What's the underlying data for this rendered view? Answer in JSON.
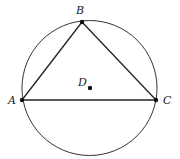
{
  "diagram": {
    "type": "geometry",
    "circle": {
      "name": "circumcircle",
      "cx": 89.5,
      "cy": 88,
      "r": 67.5,
      "stroke": "#333333"
    },
    "points": [
      {
        "label": "A",
        "x": 22,
        "y": 100,
        "label_x": 8,
        "label_y": 104
      },
      {
        "label": "B",
        "x": 82,
        "y": 22,
        "label_x": 76,
        "label_y": 14
      },
      {
        "label": "C",
        "x": 156,
        "y": 100,
        "label_x": 163,
        "label_y": 104
      },
      {
        "label": "D",
        "x": 90,
        "y": 88,
        "label_x": 78,
        "label_y": 86
      }
    ],
    "segments": [
      {
        "from": "A",
        "to": "B"
      },
      {
        "from": "B",
        "to": "C"
      },
      {
        "from": "A",
        "to": "C"
      }
    ],
    "line_color": "#222222",
    "point_color": "#111111"
  }
}
